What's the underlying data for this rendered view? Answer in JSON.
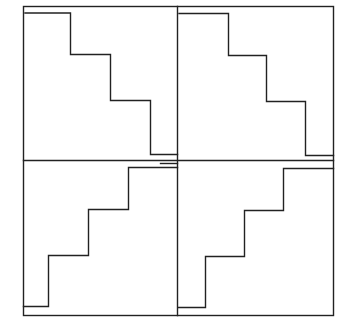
{
  "diagram": {
    "stroke_color": "#222222",
    "background": "#ffffff",
    "panels": [
      {
        "id": "top-left",
        "direction": "descending",
        "steps": 4
      },
      {
        "id": "top-right",
        "direction": "descending",
        "steps": 4
      },
      {
        "id": "bottom-left",
        "direction": "ascending",
        "steps": 4
      },
      {
        "id": "bottom-right",
        "direction": "ascending",
        "steps": 4
      }
    ]
  }
}
